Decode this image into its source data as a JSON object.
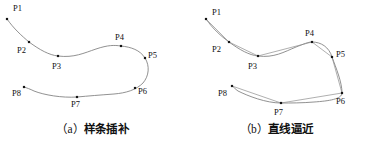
{
  "figure": {
    "panels": [
      {
        "id": "spline",
        "caption_index": "（a）",
        "caption_text": "样条插补",
        "caption_full": "（a）样条插补",
        "curve_style": "smooth-spline",
        "points": [
          {
            "label": "P1",
            "x": 7,
            "y": 19,
            "lx": 13,
            "ly": 4
          },
          {
            "label": "P2",
            "x": 29,
            "y": 42,
            "lx": 17,
            "ly": 46
          },
          {
            "label": "P3",
            "x": 58,
            "y": 56,
            "lx": 52,
            "ly": 62
          },
          {
            "label": "P4",
            "x": 121,
            "y": 46,
            "lx": 115,
            "ly": 33
          },
          {
            "label": "P5",
            "x": 145,
            "y": 58,
            "lx": 148,
            "ly": 51
          },
          {
            "label": "P6",
            "x": 135,
            "y": 88,
            "lx": 138,
            "ly": 87
          },
          {
            "label": "P7",
            "x": 77,
            "y": 97,
            "lx": 71,
            "ly": 100
          },
          {
            "label": "P8",
            "x": 24,
            "y": 87,
            "lx": 12,
            "ly": 89
          }
        ],
        "curve_path": "M 7,19 C 14,29 22,36 29,42 C 40,50 49,55 58,56 C 74,58 84,53 96,49 C 108,45 114,45 121,46 C 131,47 140,50 145,58 C 150,66 149,76 143,83 C 136,90 126,93 114,94 C 100,95 88,96 77,97 C 62,98 44,95 34,91 C 30,89 27,88 24,87"
      },
      {
        "id": "linear",
        "caption_index": "（b）",
        "caption_text": "直线逼近",
        "caption_full": "（b）直线逼近",
        "curve_style": "smooth-spline-with-chords",
        "points": [
          {
            "label": "P1",
            "x": 22,
            "y": 19,
            "lx": 28,
            "ly": 8
          },
          {
            "label": "P2",
            "x": 45,
            "y": 42,
            "lx": 28,
            "ly": 45
          },
          {
            "label": "P3",
            "x": 74,
            "y": 56,
            "lx": 64,
            "ly": 62
          },
          {
            "label": "P4",
            "x": 128,
            "y": 42,
            "lx": 121,
            "ly": 29
          },
          {
            "label": "P5",
            "x": 148,
            "y": 57,
            "lx": 152,
            "ly": 50
          },
          {
            "label": "P6",
            "x": 158,
            "y": 93,
            "lx": 152,
            "ly": 97
          },
          {
            "label": "P7",
            "x": 97,
            "y": 103,
            "lx": 90,
            "ly": 108
          },
          {
            "label": "P8",
            "x": 48,
            "y": 86,
            "lx": 34,
            "ly": 89
          }
        ],
        "curve_path": "M 22,19 C 29,29 37,36 45,42 C 56,50 65,55 74,56 C 90,58 100,52 112,47 C 120,44 124,42 128,42 C 137,42 145,47 148,57 C 152,68 158,82 158,93 C 158,99 145,101 130,102 C 118,103 107,103 97,103 C 82,103 64,96 54,91 C 51,89 50,87 48,86",
        "chord_path": "M 22,19 L 45,42 L 74,56 L 128,42 L 148,57 L 158,93 L 97,103 L 48,86"
      }
    ]
  }
}
